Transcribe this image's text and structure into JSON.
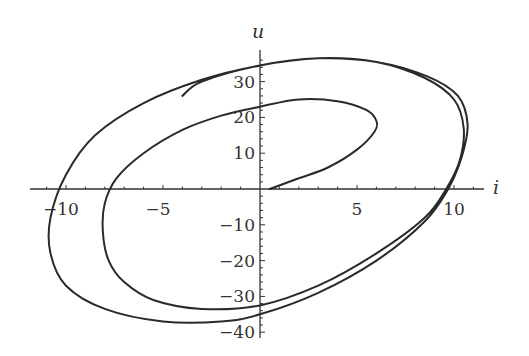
{
  "chart_data": {
    "type": "line",
    "title": "",
    "xlabel": "i",
    "ylabel": "u",
    "xlim": [
      -11.5,
      11.5
    ],
    "ylim": [
      -42,
      38
    ],
    "grid": false,
    "legend": null,
    "x_ticks": [
      -10,
      -5,
      5,
      10
    ],
    "y_ticks": [
      -40,
      -30,
      -20,
      -10,
      10,
      20,
      30
    ],
    "x_tick_labels": [
      "−10",
      "−5",
      "5",
      "10"
    ],
    "y_tick_labels": [
      "−40",
      "−30",
      "−20",
      "−10",
      "10",
      "20",
      "30"
    ],
    "series": [
      {
        "name": "trajectory (u vs i)",
        "points": [
          [
            0.5,
            0
          ],
          [
            2,
            3
          ],
          [
            3.5,
            6
          ],
          [
            5,
            11
          ],
          [
            5.9,
            16
          ],
          [
            6,
            19
          ],
          [
            5.5,
            22
          ],
          [
            4,
            24.5
          ],
          [
            2,
            25
          ],
          [
            0,
            23
          ],
          [
            -2,
            20.5
          ],
          [
            -4,
            16.5
          ],
          [
            -6,
            10
          ],
          [
            -7.4,
            3
          ],
          [
            -8,
            -4
          ],
          [
            -8.1,
            -12
          ],
          [
            -7.8,
            -20
          ],
          [
            -7,
            -26
          ],
          [
            -5.5,
            -31
          ],
          [
            -3,
            -33.5
          ],
          [
            0,
            -32.5
          ],
          [
            3,
            -27
          ],
          [
            6,
            -18
          ],
          [
            8.5,
            -8
          ],
          [
            9.6,
            0
          ],
          [
            10.3,
            8
          ],
          [
            10.5,
            17
          ],
          [
            10,
            25
          ],
          [
            8.5,
            31
          ],
          [
            6,
            35.5
          ],
          [
            3,
            36.5
          ],
          [
            0,
            34.5
          ],
          [
            -3,
            30.5
          ],
          [
            -6,
            24
          ],
          [
            -8.5,
            15
          ],
          [
            -10,
            4
          ],
          [
            -10.8,
            -8
          ],
          [
            -10.8,
            -18
          ],
          [
            -10,
            -27
          ],
          [
            -8,
            -33.5
          ],
          [
            -5,
            -37
          ],
          [
            -2,
            -37
          ],
          [
            0,
            -35
          ],
          [
            3,
            -29
          ],
          [
            6,
            -20
          ],
          [
            8.5,
            -9
          ],
          [
            9.7,
            0
          ],
          [
            10.4,
            9
          ],
          [
            10.7,
            18
          ],
          [
            10.2,
            26
          ],
          [
            8.6,
            31.5
          ],
          [
            6,
            35.5
          ],
          [
            3,
            36.5
          ],
          [
            0,
            34.5
          ],
          [
            -3,
            30
          ],
          [
            -4,
            26
          ]
        ]
      }
    ]
  }
}
